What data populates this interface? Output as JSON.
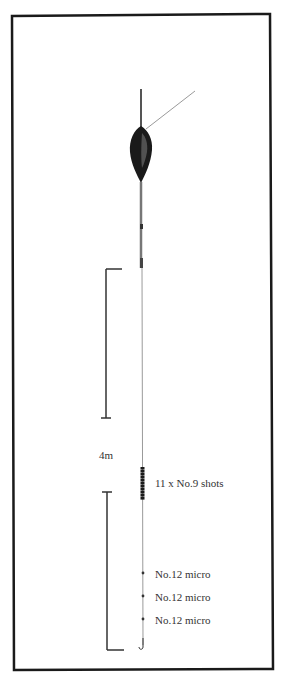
{
  "diagram": {
    "depth_label": "4m",
    "bulk_shot_label": "11 x No.9 shots",
    "dropper_labels": [
      "No.12 micro",
      "No.12 micro",
      "No.12 micro"
    ],
    "colors": {
      "ink": "#1a1a1a",
      "line": "#9a9a9a",
      "text": "#333333",
      "background": "#ffffff"
    }
  }
}
